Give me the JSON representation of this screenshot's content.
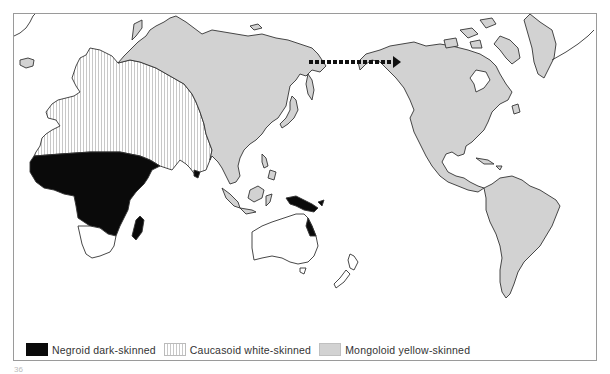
{
  "map": {
    "title": "World distribution of skin-colour groups",
    "arrow": {
      "direction": "east",
      "from": "Siberia",
      "to": "Alaska",
      "style": "dashed"
    },
    "regions": [
      {
        "id": "negroid",
        "fill": "#0a0a0a",
        "areas": [
          "Sub-Saharan Africa",
          "Madagascar",
          "Sri Lanka",
          "New Guinea / Melanesia",
          "NE Australia coast"
        ]
      },
      {
        "id": "caucasoid",
        "fill": "striped",
        "areas": [
          "Europe",
          "North Africa",
          "Middle East",
          "Indian subcontinent"
        ]
      },
      {
        "id": "mongoloid",
        "fill": "#d2d2d2",
        "areas": [
          "Northern & Eastern Asia",
          "SE Asia",
          "Indonesia",
          "North America",
          "Central America",
          "South America",
          "Greenland"
        ]
      },
      {
        "id": "unshaded",
        "fill": "#ffffff",
        "areas": [
          "Southern Africa",
          "Australia",
          "New Zealand"
        ]
      }
    ]
  },
  "legend": {
    "items": [
      {
        "label": "Negroid  dark-skinned",
        "swatch": "black"
      },
      {
        "label": "Caucasoid  white-skinned",
        "swatch": "striped"
      },
      {
        "label": "Mongoloid  yellow-skinned",
        "swatch": "grey"
      }
    ]
  },
  "page_number": "36",
  "colors": {
    "land_grey": "#d2d2d2",
    "outline": "#333333",
    "black": "#0a0a0a",
    "frame": "#9a9a9a"
  }
}
